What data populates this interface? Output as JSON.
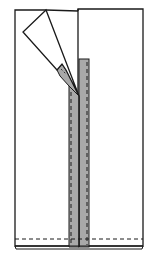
{
  "diagram": {
    "colors": {
      "background": "#ffffff",
      "outline": "#1a1a1a",
      "tape_fill": "#a9a9a9",
      "stitch": "#1a1a1a"
    },
    "parts": {
      "left_panel": {
        "label": "left-fabric-panel"
      },
      "right_panel": {
        "label": "right-fabric-panel"
      },
      "folded_flap": {
        "label": "folded-corner-flap"
      },
      "left_tape": {
        "label": "left-zipper-tape"
      },
      "right_tape": {
        "label": "right-zipper-tape"
      },
      "tape_tab": {
        "label": "folded-tape-end"
      },
      "hem_stitch": {
        "label": "hem-stitch-line"
      },
      "hem_edge": {
        "label": "hem-edge"
      }
    }
  }
}
